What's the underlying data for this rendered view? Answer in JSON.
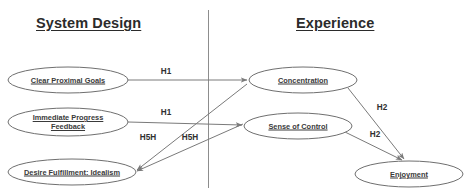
{
  "diagram": {
    "columns": [
      {
        "id": "system-design",
        "label": "System Design"
      },
      {
        "id": "experience",
        "label": "Experience"
      }
    ],
    "divider": {
      "color": "#8d8d8d"
    },
    "colors": {
      "node_stroke": "#6f6f6f",
      "node_fill": "#ffffff",
      "arrow": "#7a7a7a",
      "text": "#3a3a3a",
      "header_text": "#2b2b2b",
      "divider": "#8d8d8d",
      "background": "#ffffff"
    },
    "nodes": [
      {
        "id": "clear-proximal-goals",
        "label": "Clear Proximal Goals",
        "cx": 68,
        "cy": 80,
        "rx": 60,
        "ry": 13
      },
      {
        "id": "immediate-progress-feedback",
        "label": "Immediate Progress\nFeedback",
        "cx": 68,
        "cy": 122,
        "rx": 60,
        "ry": 14
      },
      {
        "id": "desire-fulfillment-idealism",
        "label": "Desire Fulfillment: Idealism",
        "cx": 72,
        "cy": 172,
        "rx": 64,
        "ry": 13
      },
      {
        "id": "concentration",
        "label": "Concentration",
        "cx": 303,
        "cy": 80,
        "rx": 54,
        "ry": 13
      },
      {
        "id": "sense-of-control",
        "label": "Sense of Control",
        "cx": 298,
        "cy": 126,
        "rx": 54,
        "ry": 13
      },
      {
        "id": "enjoyment",
        "label": "Enjoyment",
        "cx": 409,
        "cy": 174,
        "rx": 54,
        "ry": 13
      }
    ],
    "edges": [
      {
        "id": "goals-to-concentration",
        "from": "clear-proximal-goals",
        "to": "concentration",
        "label": "H1",
        "label_x": 166,
        "label_y": 71
      },
      {
        "id": "feedback-to-control",
        "from": "immediate-progress-feedback",
        "to": "sense-of-control",
        "label": "H1",
        "label_x": 166,
        "label_y": 112
      },
      {
        "id": "desire-to-concentration",
        "from": "desire-fulfillment-idealism",
        "to": "concentration",
        "label": "H5H",
        "label_x": 148,
        "label_y": 137
      },
      {
        "id": "desire-to-control",
        "from": "desire-fulfillment-idealism",
        "to": "sense-of-control",
        "label": "H5H",
        "label_x": 190,
        "label_y": 137
      },
      {
        "id": "concentration-to-enjoyment",
        "from": "concentration",
        "to": "enjoyment",
        "label": "H2",
        "label_x": 382,
        "label_y": 107
      },
      {
        "id": "control-to-enjoyment",
        "from": "sense-of-control",
        "to": "enjoyment",
        "label": "H2",
        "label_x": 375,
        "label_y": 134
      }
    ]
  }
}
